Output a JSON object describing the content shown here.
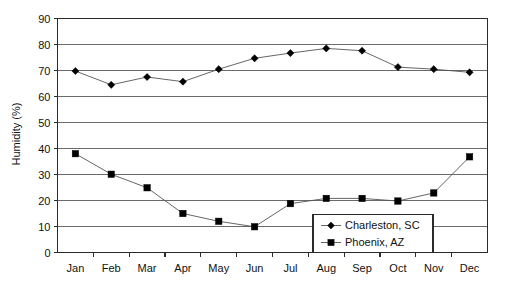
{
  "chart_data": {
    "type": "line",
    "title": "",
    "xlabel": "",
    "ylabel": "Humidity (%)",
    "ylim": [
      0,
      90
    ],
    "ytick_step": 10,
    "yticks": [
      "0",
      "10",
      "20",
      "30",
      "40",
      "50",
      "60",
      "70",
      "80",
      "90"
    ],
    "grid": true,
    "legend_position": "lower-right",
    "categories": [
      "Jan",
      "Feb",
      "Mar",
      "Apr",
      "May",
      "Jun",
      "Jul",
      "Aug",
      "Sep",
      "Oct",
      "Nov",
      "Dec"
    ],
    "series": [
      {
        "name": "Charleston, SC",
        "marker": "diamond",
        "color": "#000000",
        "values": [
          69.8,
          64.5,
          67.5,
          65.7,
          70.5,
          74.7,
          76.7,
          78.5,
          77.6,
          71.3,
          70.5,
          69.3
        ]
      },
      {
        "name": "Phoenix, AZ",
        "marker": "square",
        "color": "#000000",
        "values": [
          38.0,
          30.1,
          24.9,
          15.0,
          12.0,
          9.9,
          18.8,
          20.8,
          20.8,
          19.8,
          22.9,
          36.8
        ]
      }
    ]
  },
  "legend": {
    "entries": [
      {
        "label": "Charleston, SC",
        "marker": "diamond-marker-icon"
      },
      {
        "label": "Phoenix, AZ",
        "marker": "square-marker-icon"
      }
    ]
  },
  "colors": {
    "axis": "#2b2b2b",
    "grid": "#5a5a5a",
    "line": "#555555",
    "marker": "#000000",
    "background": "#ffffff"
  }
}
